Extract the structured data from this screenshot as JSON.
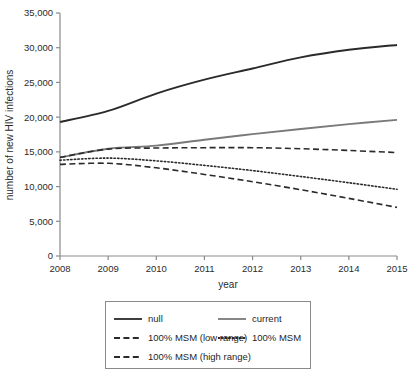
{
  "chart_data": {
    "type": "line",
    "title": "",
    "xlabel": "year",
    "ylabel": "number of new HIV infections",
    "x": [
      2008,
      2009,
      2010,
      2011,
      2012,
      2013,
      2014,
      2015
    ],
    "xtick_labels": [
      "2008",
      "2009",
      "2010",
      "2011",
      "2012",
      "2013",
      "2014",
      "2015"
    ],
    "xlim": [
      2008,
      2015
    ],
    "ylim": [
      0,
      35000
    ],
    "ytick_values": [
      0,
      5000,
      10000,
      15000,
      20000,
      25000,
      30000,
      35000
    ],
    "ytick_labels": [
      "0",
      "5,000",
      "10,000",
      "15,000",
      "20,000",
      "25,000",
      "30,000",
      "35,000"
    ],
    "grid": false,
    "legend_position": "below-axis",
    "series": [
      {
        "name": "null",
        "style": "solid",
        "color": "#2a2a2a",
        "width": 1.9,
        "values": [
          19300,
          20900,
          23400,
          25400,
          27000,
          28600,
          29700,
          30400
        ]
      },
      {
        "name": "current",
        "style": "solid",
        "color": "#7a7a7a",
        "width": 1.9,
        "values": [
          14200,
          15450,
          15900,
          16750,
          17550,
          18300,
          19000,
          19600
        ]
      },
      {
        "name": "100% MSM (low range)",
        "style": "dashed",
        "color": "#2a2a2a",
        "width": 1.6,
        "values": [
          14200,
          15400,
          15550,
          15600,
          15600,
          15450,
          15200,
          14900
        ]
      },
      {
        "name": "100% MSM",
        "style": "dotted",
        "color": "#2a2a2a",
        "width": 1.6,
        "values": [
          13800,
          14100,
          13700,
          13050,
          12300,
          11450,
          10550,
          9600
        ]
      },
      {
        "name": "100% MSM (high range)",
        "style": "dashed",
        "color": "#2a2a2a",
        "width": 1.6,
        "values": [
          13200,
          13350,
          12700,
          11750,
          10700,
          9550,
          8300,
          7000
        ]
      }
    ]
  },
  "axes": {
    "y_axis_title": "number of new HIV infections",
    "x_axis_title": "year",
    "y_ticks": [
      "35,000",
      "30,000",
      "25,000",
      "20,000",
      "15,000",
      "10,000",
      "5,000",
      "0"
    ],
    "x_ticks": [
      "2008",
      "2009",
      "2010",
      "2011",
      "2012",
      "2013",
      "2014",
      "2015"
    ]
  },
  "legend": {
    "items": [
      {
        "label": "null",
        "style": "solid",
        "color": "#2a2a2a",
        "column": 0,
        "row": 0
      },
      {
        "label": "current",
        "style": "solid",
        "color": "#7a7a7a",
        "column": 1,
        "row": 0
      },
      {
        "label": "100% MSM (low range)",
        "style": "dashed",
        "color": "#2a2a2a",
        "column": 0,
        "row": 1
      },
      {
        "label": "100% MSM",
        "style": "dotted",
        "color": "#2a2a2a",
        "column": 1,
        "row": 1
      },
      {
        "label": "100% MSM (high range)",
        "style": "dashed",
        "color": "#2a2a2a",
        "column": 0,
        "row": 2
      }
    ]
  },
  "colors": {
    "axis": "#8a8a8a",
    "text": "#1f1f1f",
    "series_dark": "#2a2a2a",
    "series_gray": "#7a7a7a",
    "background": "#ffffff"
  }
}
